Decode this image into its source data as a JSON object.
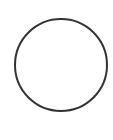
{
  "shape": {
    "type": "circle",
    "cx": 61,
    "cy": 65,
    "r": 46,
    "stroke": "#333333",
    "stroke_width": 2,
    "fill": "#ffffff"
  },
  "background": "#ffffff"
}
